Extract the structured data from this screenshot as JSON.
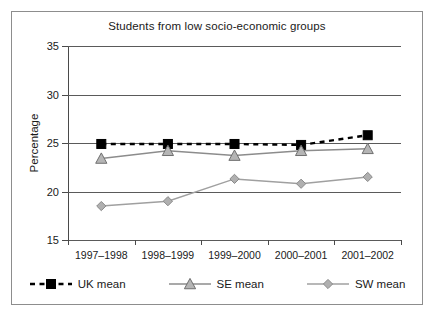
{
  "chart_data": {
    "type": "line",
    "title": "Students from low socio-economic groups",
    "xlabel": "",
    "ylabel": "Percentage",
    "categories": [
      "1997–1998",
      "1998–1999",
      "1999–2000",
      "2000–2001",
      "2001–2002"
    ],
    "ylim": [
      15,
      35
    ],
    "yticks": [
      15,
      20,
      25,
      30,
      35
    ],
    "ytick_labels": [
      "15",
      "20",
      "25",
      "30",
      "35"
    ],
    "grid": true,
    "legend_position": "bottom",
    "series": [
      {
        "name": "UK mean",
        "values": [
          24.9,
          24.9,
          24.9,
          24.8,
          25.8
        ],
        "color": "#000000",
        "linestyle": "dashed",
        "marker": "square"
      },
      {
        "name": "SE mean",
        "values": [
          23.4,
          24.2,
          23.7,
          24.2,
          24.4
        ],
        "color": "#8c8c8c",
        "linestyle": "solid",
        "marker": "triangle"
      },
      {
        "name": "SW mean",
        "values": [
          18.5,
          19.0,
          21.3,
          20.8,
          21.5
        ],
        "color": "#a0a0a0",
        "linestyle": "solid",
        "marker": "diamond"
      }
    ]
  },
  "legend": {
    "items": [
      {
        "label": "UK mean",
        "icon": "dashed-line-square-marker"
      },
      {
        "label": "SE mean",
        "icon": "solid-line-triangle-marker"
      },
      {
        "label": "SW mean",
        "icon": "solid-line-diamond-marker"
      }
    ]
  },
  "colors": {
    "frame": "#8d8d8d",
    "axis": "#4a4a4a",
    "gridline": "#5a5a5a",
    "background": "#ffffff",
    "uk": "#000000",
    "se": "#8c8c8c",
    "sw": "#a0a0a0"
  }
}
